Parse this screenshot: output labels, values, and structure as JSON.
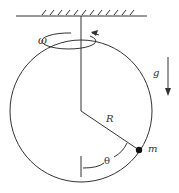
{
  "diagram": {
    "type": "physics-rotating-hoop",
    "labels": {
      "omega": "ω",
      "gravity": "g",
      "radius": "R",
      "angle": "θ",
      "mass": "m"
    },
    "colors": {
      "stroke": "#333333",
      "background": "#ffffff"
    }
  }
}
